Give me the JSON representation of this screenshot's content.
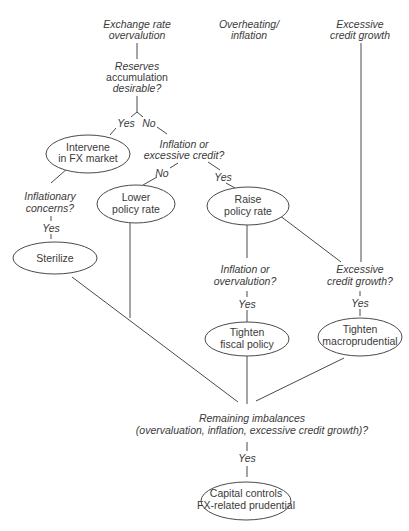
{
  "diagram": {
    "roots": {
      "exchange_rate": [
        "Exchange rate",
        "overvalution"
      ],
      "overheating": [
        "Overheating/",
        "inflation"
      ],
      "credit": [
        "Excessive",
        "credit growth"
      ]
    },
    "questions": {
      "reserves": [
        "Reserves",
        "accumulation",
        "desirable?"
      ],
      "inflation_credit": [
        "Inflation or",
        "excessive credit?"
      ],
      "inflationary_concerns": [
        "Inflationary",
        "concerns?"
      ],
      "inflation_overvaluation": [
        "Inflation or",
        "overvalution?"
      ],
      "excessive_credit": [
        "Excessive",
        "credit growth?"
      ],
      "remaining": [
        "Remaining imbalances",
        "(overvaluation, inflation, excessive credit growth)?"
      ]
    },
    "actions": {
      "intervene": [
        "Intervene",
        "in FX market"
      ],
      "lower_rate": [
        "Lower",
        "policy rate"
      ],
      "raise_rate": [
        "Raise",
        "policy rate"
      ],
      "sterilize": [
        "Sterilize"
      ],
      "tighten_fiscal": [
        "Tighten",
        "fiscal policy"
      ],
      "tighten_macro": [
        "Tighten",
        "macroprudential"
      ],
      "capital_controls": [
        "Capital controls",
        "FX-related prudential"
      ]
    },
    "edge_labels": {
      "reserves_yes": "Yes",
      "reserves_no": "No",
      "inflation_credit_no": "No",
      "inflation_credit_yes": "Yes",
      "inflationary_yes": "Yes",
      "inflation_overvaluation_yes": "Yes",
      "excessive_credit_yes": "Yes",
      "remaining_yes": "Yes"
    }
  }
}
